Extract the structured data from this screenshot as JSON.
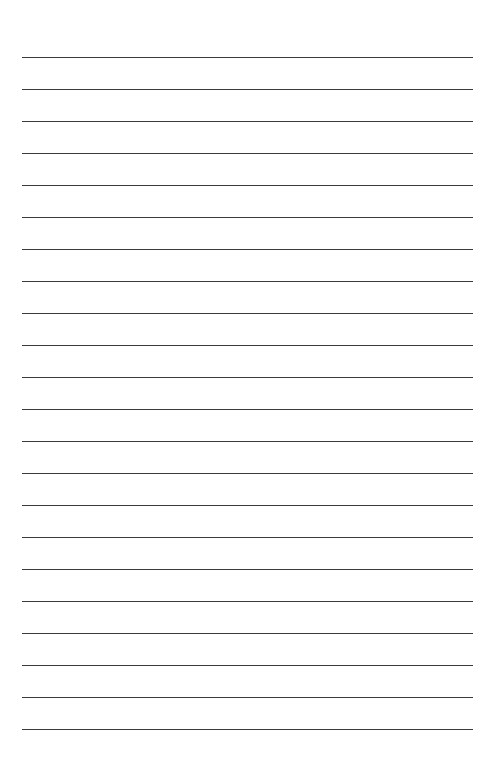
{
  "page": {
    "kind": "lined-paper",
    "width": 493,
    "height": 769,
    "background_color": "#ffffff",
    "text_content": ""
  },
  "ruling": {
    "line_color": "#3a3a3a",
    "line_thickness": 1.4,
    "line_count": 22,
    "line_spacing": 32,
    "first_line_y": 57,
    "last_line_y": 729,
    "left_margin": 22,
    "right_margin": 20,
    "line_left_x": 22,
    "line_right_x": 473,
    "line_length": 451,
    "top_blank_space": 57,
    "bottom_blank_space": 40,
    "margin_rule_visible": false,
    "line_y_positions": [
      57,
      89,
      121,
      153,
      185,
      217,
      249,
      281,
      313,
      345,
      377,
      409,
      441,
      473,
      505,
      537,
      569,
      601,
      633,
      665,
      697,
      729
    ],
    "line_labels": [
      "rule-line-1",
      "rule-line-2",
      "rule-line-3",
      "rule-line-4",
      "rule-line-5",
      "rule-line-6",
      "rule-line-7",
      "rule-line-8",
      "rule-line-9",
      "rule-line-10",
      "rule-line-11",
      "rule-line-12",
      "rule-line-13",
      "rule-line-14",
      "rule-line-15",
      "rule-line-16",
      "rule-line-17",
      "rule-line-18",
      "rule-line-19",
      "rule-line-20",
      "rule-line-21",
      "rule-line-22"
    ],
    "line_text": [
      "",
      "",
      "",
      "",
      "",
      "",
      "",
      "",
      "",
      "",
      "",
      "",
      "",
      "",
      "",
      "",
      "",
      "",
      "",
      "",
      "",
      ""
    ]
  }
}
